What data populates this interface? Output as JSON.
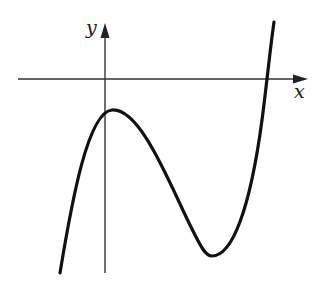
{
  "figure": {
    "axes": {
      "x_label": "x",
      "y_label": "y"
    },
    "colors": {
      "curve": "#111111",
      "axis": "#333333",
      "background": "#ffffff"
    },
    "curve_features": {
      "type": "cubic",
      "local_max": "below x-axis, slightly right of y-axis",
      "local_min": "below x-axis, right of local max",
      "x_intercepts": 1,
      "end_behavior": "down on left, up on right"
    }
  }
}
